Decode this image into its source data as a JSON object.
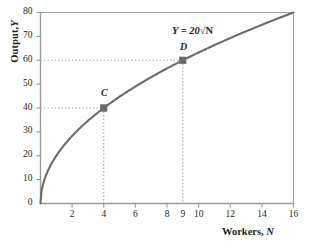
{
  "chart_data": {
    "type": "line",
    "title": "",
    "subtitle": "",
    "xlabel_bold": "Workers,",
    "xlabel_italic": "N",
    "ylabel_bold": "Output,",
    "ylabel_italic": "Y",
    "equation_text": "Y = 20",
    "equation_radical": "√N",
    "equation_full": "Y = 20√N",
    "xlim": [
      0,
      16
    ],
    "ylim": [
      0,
      80
    ],
    "grid": false,
    "legend": "none",
    "x_ticks": [
      2,
      4,
      6,
      8,
      9,
      10,
      12,
      14,
      16
    ],
    "x_tick_labels": [
      "2",
      "4",
      "6",
      "8",
      "9",
      "10",
      "12",
      "14",
      "16"
    ],
    "y_ticks": [
      0,
      10,
      20,
      30,
      40,
      50,
      60,
      70,
      80
    ],
    "y_tick_labels": [
      "0",
      "10",
      "20",
      "30",
      "40",
      "50",
      "60",
      "70",
      "80"
    ],
    "series": [
      {
        "name": "Y = 20√N",
        "function": "20*sqrt(N)",
        "x": [
          0,
          0.25,
          0.5,
          1,
          1.5,
          2,
          2.5,
          3,
          3.5,
          4,
          5,
          6,
          7,
          8,
          9,
          10,
          11,
          12,
          13,
          14,
          15,
          16
        ],
        "values": [
          0,
          10,
          14.1,
          20,
          24.5,
          28.3,
          31.6,
          34.6,
          37.4,
          40,
          44.7,
          49,
          52.9,
          56.6,
          60,
          63.2,
          66.3,
          69.3,
          72.1,
          74.8,
          77.5,
          80
        ]
      }
    ],
    "annotated_points": [
      {
        "label": "C",
        "x": 4,
        "y": 40,
        "marker": "square",
        "guide_lines": "dotted"
      },
      {
        "label": "D",
        "x": 9,
        "y": 60,
        "marker": "square",
        "guide_lines": "dotted"
      }
    ],
    "colors": {
      "curve": "#6b6b6b",
      "axis": "#9a9a9a",
      "marker": "#6b6b6b",
      "guide": "#a9a093",
      "text": "#231f20",
      "background": "#ffffff"
    }
  }
}
